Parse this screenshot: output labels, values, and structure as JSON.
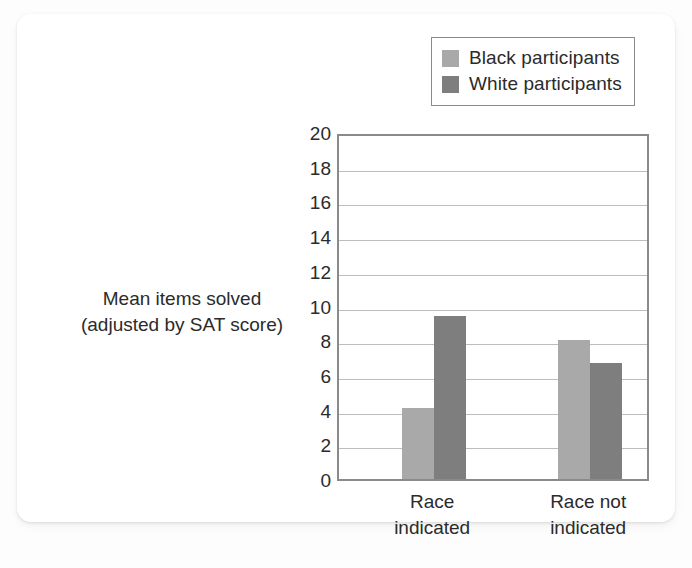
{
  "figure": {
    "background_color": "#ffffff",
    "page_background": "#fdfdfd"
  },
  "legend": {
    "position": "top-right",
    "entries": [
      {
        "label": "Black participants",
        "color": "#a9a9a9",
        "swatch_name": "legend-swatch-black-participants"
      },
      {
        "label": "White participants",
        "color": "#7e7e7e",
        "swatch_name": "legend-swatch-white-participants"
      }
    ]
  },
  "axis_title": {
    "line1": "Mean items solved",
    "line2": "(adjusted by SAT score)"
  },
  "chart_data": {
    "type": "bar",
    "title": "",
    "xlabel": "",
    "ylabel": "Mean items solved (adjusted by SAT score)",
    "categories": [
      "Race indicated",
      "Race not indicated"
    ],
    "category_lines": [
      [
        "Race",
        "indicated"
      ],
      [
        "Race not",
        "indicated"
      ]
    ],
    "series": [
      {
        "name": "Black participants",
        "color": "#a9a9a9",
        "values": [
          4.1,
          8.0
        ]
      },
      {
        "name": "White participants",
        "color": "#7e7e7e",
        "values": [
          9.4,
          6.7
        ]
      }
    ],
    "ylim": [
      0,
      20
    ],
    "ytick_step": 2,
    "yticks": [
      0,
      2,
      4,
      6,
      8,
      10,
      12,
      14,
      16,
      18,
      20
    ],
    "ytick_labels": [
      "0",
      "2",
      "4",
      "6",
      "8",
      "10",
      "12",
      "14",
      "16",
      "18",
      "20"
    ],
    "grid": true,
    "grid_axis": "y",
    "grid_color": "#bdbdbd",
    "axis_color": "#8a8a8a",
    "legend_position": "upper right"
  }
}
